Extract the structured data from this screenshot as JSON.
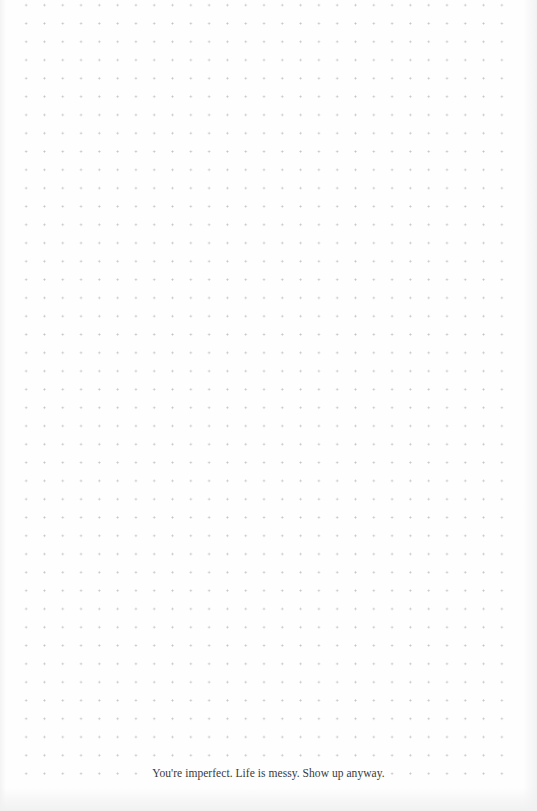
{
  "page": {
    "type": "dot-grid journal page",
    "background_color": "#fefefe",
    "dot_color": "#b9b9b9",
    "grid": {
      "spacing_px": 18.3,
      "columns": 27,
      "rows": 43
    }
  },
  "footer": {
    "quote": "You're imperfect. Life is messy. Show up anyway.",
    "text_color": "#3a3a3a"
  }
}
